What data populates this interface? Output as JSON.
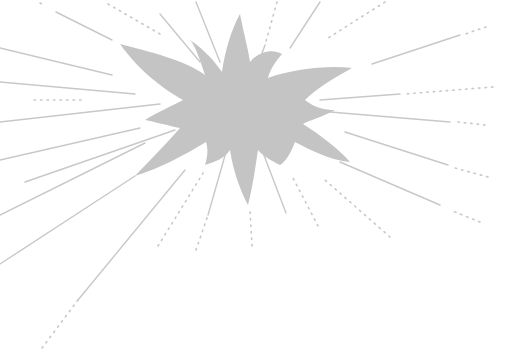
{
  "illustration": {
    "subject": "gray starburst explosion with radiating lines",
    "width": 524,
    "height": 359,
    "background": "#ffffff",
    "colors": {
      "burst_fill": "#c4c4c4",
      "ray_stroke": "#c8c8c8",
      "dot_fill": "#c8c8c8"
    },
    "burst_path": "M120 44 C150 52 185 60 205 75 C200 60 195 45 190 40 C205 50 215 62 222 72 C225 50 232 28 240 14 C243 30 248 48 250 62 C258 52 272 48 282 54 C275 62 270 70 268 78 C290 70 325 65 352 68 C330 80 315 90 305 100 C315 108 325 110 335 110 C320 118 310 120 303 124 C320 135 338 148 350 162 C330 160 310 150 295 142 C290 155 285 162 280 165 C270 160 262 155 258 150 C255 170 252 190 248 205 C240 190 233 170 230 150 C225 158 215 162 205 165 C208 155 208 148 206 142 C185 155 160 168 135 176 C150 160 170 140 180 128 C170 126 155 122 145 120 C158 112 172 106 183 100 C165 90 140 72 120 44 Z",
    "rays": [
      {
        "x1": 56,
        "y1": 12,
        "x2": 112,
        "y2": 40,
        "style": "solid"
      },
      {
        "x1": 0,
        "y1": 48,
        "x2": 112,
        "y2": 75,
        "style": "solid"
      },
      {
        "x1": 0,
        "y1": 82,
        "x2": 135,
        "y2": 94,
        "style": "solid"
      },
      {
        "x1": 34,
        "y1": 100,
        "x2": 85,
        "y2": 100,
        "style": "dotted"
      },
      {
        "x1": 0,
        "y1": 122,
        "x2": 160,
        "y2": 104,
        "style": "solid"
      },
      {
        "x1": 0,
        "y1": 160,
        "x2": 140,
        "y2": 128,
        "style": "solid"
      },
      {
        "x1": 25,
        "y1": 182,
        "x2": 175,
        "y2": 130,
        "style": "solid"
      },
      {
        "x1": 0,
        "y1": 215,
        "x2": 145,
        "y2": 143,
        "style": "solid"
      },
      {
        "x1": 0,
        "y1": 264,
        "x2": 135,
        "y2": 176,
        "style": "solid"
      },
      {
        "x1": 78,
        "y1": 300,
        "x2": 185,
        "y2": 170,
        "style": "solid"
      },
      {
        "x1": 42,
        "y1": 348,
        "x2": 78,
        "y2": 300,
        "style": "dotted"
      },
      {
        "x1": 158,
        "y1": 246,
        "x2": 205,
        "y2": 170,
        "style": "dotted"
      },
      {
        "x1": 196,
        "y1": 250,
        "x2": 208,
        "y2": 215,
        "style": "dotted"
      },
      {
        "x1": 208,
        "y1": 215,
        "x2": 228,
        "y2": 145,
        "style": "solid"
      },
      {
        "x1": 252,
        "y1": 246,
        "x2": 250,
        "y2": 210,
        "style": "dotted"
      },
      {
        "x1": 286,
        "y1": 213,
        "x2": 262,
        "y2": 150,
        "style": "solid"
      },
      {
        "x1": 318,
        "y1": 226,
        "x2": 293,
        "y2": 178,
        "style": "dotted"
      },
      {
        "x1": 390,
        "y1": 237,
        "x2": 325,
        "y2": 180,
        "style": "dotted"
      },
      {
        "x1": 440,
        "y1": 205,
        "x2": 340,
        "y2": 162,
        "style": "solid"
      },
      {
        "x1": 480,
        "y1": 222,
        "x2": 450,
        "y2": 210,
        "style": "dotted"
      },
      {
        "x1": 448,
        "y1": 165,
        "x2": 345,
        "y2": 132,
        "style": "solid"
      },
      {
        "x1": 488,
        "y1": 177,
        "x2": 455,
        "y2": 168,
        "style": "dotted"
      },
      {
        "x1": 450,
        "y1": 122,
        "x2": 330,
        "y2": 112,
        "style": "solid"
      },
      {
        "x1": 485,
        "y1": 125,
        "x2": 458,
        "y2": 122,
        "style": "dotted"
      },
      {
        "x1": 400,
        "y1": 94,
        "x2": 320,
        "y2": 100,
        "style": "solid"
      },
      {
        "x1": 493,
        "y1": 87,
        "x2": 405,
        "y2": 94,
        "style": "dotted"
      },
      {
        "x1": 460,
        "y1": 35,
        "x2": 372,
        "y2": 64,
        "style": "solid"
      },
      {
        "x1": 486,
        "y1": 27,
        "x2": 465,
        "y2": 34,
        "style": "dotted"
      },
      {
        "x1": 385,
        "y1": 2,
        "x2": 325,
        "y2": 40,
        "style": "dotted"
      },
      {
        "x1": 320,
        "y1": 2,
        "x2": 290,
        "y2": 48,
        "style": "solid"
      },
      {
        "x1": 277,
        "y1": 2,
        "x2": 265,
        "y2": 45,
        "style": "dotted"
      },
      {
        "x1": 265,
        "y1": 45,
        "x2": 256,
        "y2": 70,
        "style": "solid"
      },
      {
        "x1": 196,
        "y1": 2,
        "x2": 220,
        "y2": 62,
        "style": "solid"
      },
      {
        "x1": 160,
        "y1": 14,
        "x2": 200,
        "y2": 62,
        "style": "solid"
      },
      {
        "x1": 108,
        "y1": 4,
        "x2": 160,
        "y2": 34,
        "style": "dotted"
      },
      {
        "x1": 40,
        "y1": 3,
        "x2": 44,
        "y2": 5,
        "style": "dotted"
      }
    ]
  }
}
